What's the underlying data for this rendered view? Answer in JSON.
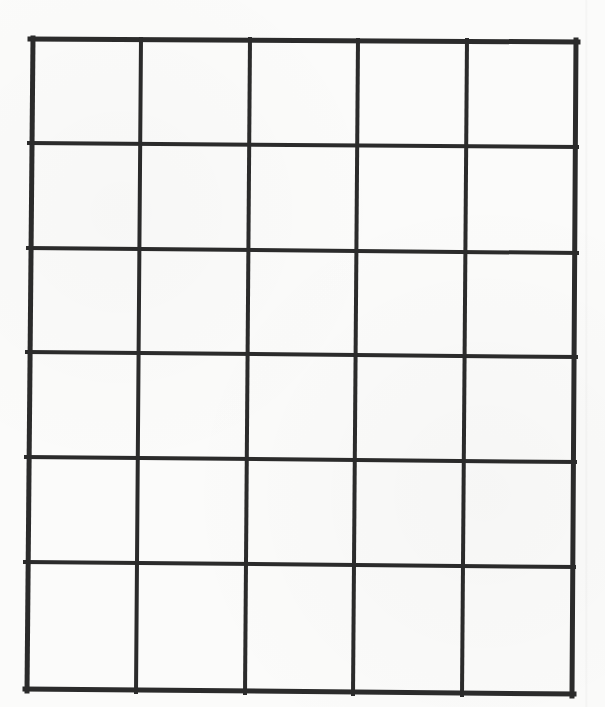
{
  "diagram": {
    "type": "blank-grid-table",
    "columns": 5,
    "rows": 6,
    "line_color": "#2b2b2b",
    "background_color": "#fbfbfa",
    "outer_stroke_width": 5,
    "inner_stroke_width": 4,
    "vertical_lines_top": [
      [
        33,
        40
      ],
      [
        141,
        41
      ],
      [
        250,
        41
      ],
      [
        358,
        42
      ],
      [
        467,
        42
      ],
      [
        576,
        42
      ]
    ],
    "vertical_lines_bottom": [
      [
        27,
        689
      ],
      [
        136,
        690
      ],
      [
        245,
        691
      ],
      [
        353,
        692
      ],
      [
        462,
        693
      ],
      [
        572,
        694
      ]
    ],
    "horizontal_lines_left": [
      [
        32,
        39
      ],
      [
        31,
        143
      ],
      [
        30,
        248
      ],
      [
        29,
        352
      ],
      [
        28,
        457
      ],
      [
        27,
        562
      ],
      [
        27,
        689
      ]
    ],
    "horizontal_lines_right": [
      [
        576,
        42
      ],
      [
        575,
        147
      ],
      [
        575,
        253
      ],
      [
        574,
        357
      ],
      [
        573,
        462
      ],
      [
        572,
        567
      ],
      [
        572,
        694
      ]
    ],
    "cells": [
      [
        "",
        "",
        "",
        "",
        ""
      ],
      [
        "",
        "",
        "",
        "",
        ""
      ],
      [
        "",
        "",
        "",
        "",
        ""
      ],
      [
        "",
        "",
        "",
        "",
        ""
      ],
      [
        "",
        "",
        "",
        "",
        ""
      ],
      [
        "",
        "",
        "",
        "",
        ""
      ]
    ]
  }
}
